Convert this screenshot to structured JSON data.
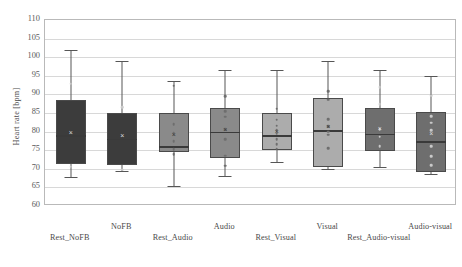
{
  "chart_data": {
    "type": "box",
    "title": "",
    "xlabel": "",
    "ylabel": "Heart rate [bpm]",
    "ylim": [
      60,
      110
    ],
    "ytick_step": 5,
    "yticks": [
      110,
      105,
      100,
      95,
      90,
      85,
      80,
      75,
      70,
      65,
      60
    ],
    "grid": true,
    "legend": "none",
    "categories": [
      "Rest_NoFB",
      "NoFB",
      "Rest_Audio",
      "Audio",
      "Rest_Visual",
      "Visual",
      "Rest_Audio-visual",
      "Audio-visual"
    ],
    "boxes": [
      {
        "label": "Rest_NoFB",
        "fill": "#3c3c3c",
        "whisker_low": 67.8,
        "q1": 71.4,
        "median": 79.0,
        "q3": 88.6,
        "whisker_high": 102.0,
        "mean": 80.0,
        "points": [
          92.9,
          70.6
        ],
        "point_style": "light"
      },
      {
        "label": "NoFB",
        "fill": "#3c3c3c",
        "whisker_low": 69.4,
        "q1": 71.0,
        "median": 78.0,
        "q3": 85.0,
        "whisker_high": 99.0,
        "mean": 79.2,
        "points": [
          86.6,
          69.8
        ],
        "point_style": "light"
      },
      {
        "label": "Rest_Audio",
        "fill": "#8a8a8a",
        "whisker_low": 65.5,
        "q1": 74.6,
        "median": 76.0,
        "q3": 85.0,
        "whisker_high": 93.5,
        "mean": 79.4,
        "points": [
          92.3,
          82.0,
          79.6,
          77.4,
          75.2,
          74.0
        ],
        "point_style": "dark"
      },
      {
        "label": "Audio",
        "fill": "#8a8a8a",
        "whisker_low": 68.0,
        "q1": 73.0,
        "median": 80.0,
        "q3": 86.3,
        "whisker_high": 96.5,
        "mean": 80.6,
        "points": [
          89.5,
          85.5,
          84.0,
          80.6,
          78.0,
          73.5,
          70.8
        ],
        "point_style": "dark"
      },
      {
        "label": "Rest_Visual",
        "fill": "#acacac",
        "whisker_low": 71.8,
        "q1": 75.0,
        "median": 79.0,
        "q3": 85.0,
        "whisker_high": 96.5,
        "mean": 80.2,
        "points": [
          86.2,
          83.2,
          81.6,
          80.4,
          79.4,
          78.0,
          76.6,
          75.4
        ],
        "point_style": "dark"
      },
      {
        "label": "Visual",
        "fill": "#acacac",
        "whisker_low": 70.0,
        "q1": 70.6,
        "median": 80.4,
        "q3": 89.0,
        "whisker_high": 99.0,
        "mean": 81.5,
        "points": [
          90.8,
          88.6,
          83.4,
          81.4,
          80.0,
          79.2,
          75.6
        ],
        "point_style": "dark"
      },
      {
        "label": "Rest_Audio-visual",
        "fill": "#6e6e6e",
        "whisker_low": 70.6,
        "q1": 74.8,
        "median": 79.4,
        "q3": 86.4,
        "whisker_high": 96.5,
        "mean": 81.0,
        "points": [
          92.0,
          87.4,
          80.6,
          78.6,
          76.0
        ],
        "point_style": "light"
      },
      {
        "label": "Audio-visual",
        "fill": "#6e6e6e",
        "whisker_low": 68.6,
        "q1": 69.2,
        "median": 77.4,
        "q3": 85.4,
        "whisker_high": 95.0,
        "mean": 79.6,
        "points": [
          89.6,
          84.2,
          82.4,
          80.4,
          76.0,
          73.4,
          71.0
        ],
        "point_style": "light"
      }
    ]
  }
}
